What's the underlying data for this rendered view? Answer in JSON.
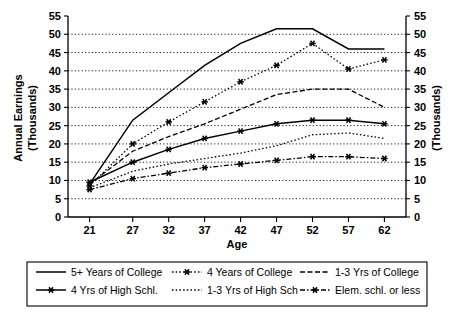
{
  "chart_data": {
    "type": "line",
    "title": "",
    "xlabel": "Age",
    "ylabel": "Annual Earnings (Thousands)",
    "ylabel_right": "(Thousands)",
    "x": [
      21,
      27,
      32,
      37,
      42,
      47,
      52,
      57,
      62
    ],
    "xticks": [
      "21",
      "27",
      "32",
      "37",
      "42",
      "47",
      "52",
      "57",
      "62"
    ],
    "yticks": [
      "0",
      "5",
      "10",
      "15",
      "20",
      "25",
      "30",
      "35",
      "40",
      "45",
      "50",
      "55"
    ],
    "yticks_right": [
      "0",
      "5",
      "10",
      "15",
      "20",
      "25",
      "30",
      "35",
      "40",
      "45",
      "50",
      "55"
    ],
    "xlim": [
      18,
      65
    ],
    "ylim": [
      0,
      55
    ],
    "grid": true,
    "legend_position": "bottom",
    "series": [
      {
        "name": "5+ Years of College",
        "style": "solid",
        "marker": "none",
        "values": [
          9.0,
          26.5,
          34.0,
          41.5,
          47.5,
          51.5,
          51.5,
          46.0,
          46.0
        ]
      },
      {
        "name": "4 Years of College",
        "style": "dotted",
        "marker": "star",
        "values": [
          8.5,
          20.0,
          26.0,
          31.5,
          37.0,
          41.5,
          47.5,
          40.5,
          43.0
        ]
      },
      {
        "name": "1-3 Yrs of College",
        "style": "dashed",
        "marker": "none",
        "values": [
          9.0,
          18.0,
          22.0,
          25.5,
          29.5,
          33.5,
          35.0,
          35.0,
          30.0
        ]
      },
      {
        "name": "4 Yrs of High Schl.",
        "style": "solid",
        "marker": "star",
        "values": [
          9.5,
          15.0,
          18.5,
          21.5,
          23.5,
          25.5,
          26.5,
          26.5,
          25.5
        ]
      },
      {
        "name": "1-3 Yrs of High Sch",
        "style": "dotted",
        "marker": "none",
        "values": [
          8.0,
          12.5,
          14.5,
          16.0,
          17.5,
          19.5,
          22.5,
          23.0,
          21.5
        ]
      },
      {
        "name": "Elem. schl. or less",
        "style": "dash-dot",
        "marker": "star",
        "values": [
          7.5,
          10.5,
          12.0,
          13.5,
          14.5,
          15.5,
          16.5,
          16.5,
          16.0
        ]
      }
    ],
    "highlighted_series": {
      "name": "4 Yrs of High Schl.",
      "start_value": 15.0
    }
  },
  "legend": {
    "entries": [
      {
        "label": "5+ Years of College",
        "icon": "solid-line-swatch"
      },
      {
        "label": "4 Years of College",
        "icon": "dotted-star-line-swatch"
      },
      {
        "label": "1-3 Yrs of College",
        "icon": "dashed-line-swatch"
      },
      {
        "label": "4 Yrs of High Schl.",
        "icon": "solid-star-line-swatch"
      },
      {
        "label": "1-3 Yrs of High Sch",
        "icon": "dotted-line-swatch"
      },
      {
        "label": "Elem. schl. or less",
        "icon": "dash-dot-star-line-swatch"
      }
    ]
  }
}
